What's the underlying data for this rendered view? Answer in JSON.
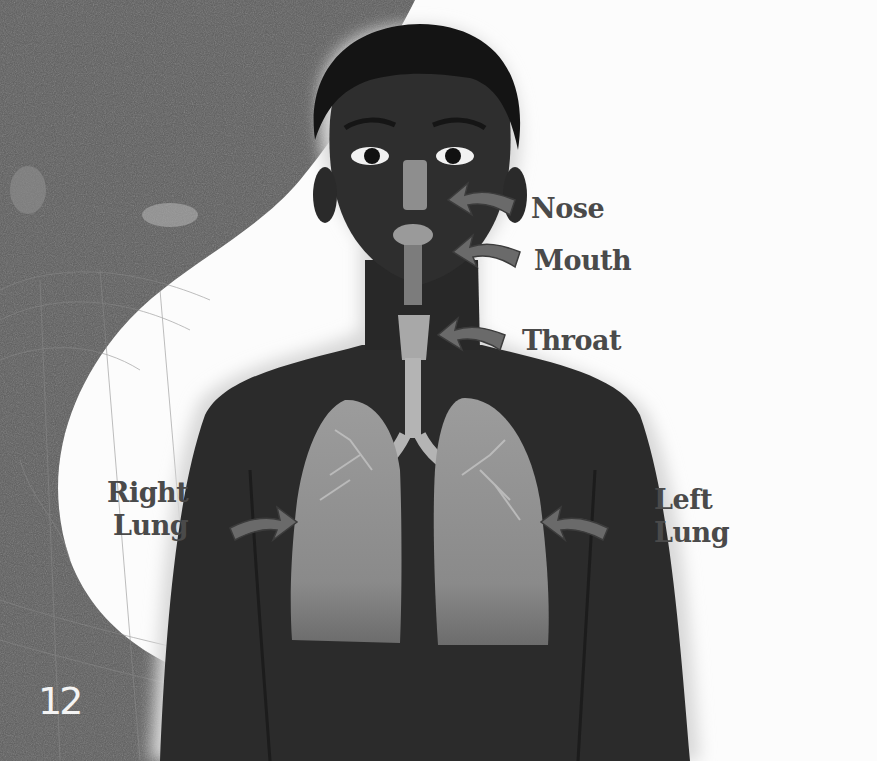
{
  "page": {
    "number": "12",
    "style": "grayscale textbook illustration"
  },
  "figure": {
    "labels": {
      "nose": "Nose",
      "mouth": "Mouth",
      "throat": "Throat",
      "right_lung": [
        "Right",
        "Lung"
      ],
      "left_lung": [
        "Left",
        "Lung"
      ]
    }
  },
  "colors": {
    "background": "#fcfcfc",
    "texture": "#5a5a5a",
    "skin": "#2a2a2a",
    "organ": "#8e8e8e",
    "arrow": "#6a6a6a",
    "label_text": "#4a4a4a"
  }
}
